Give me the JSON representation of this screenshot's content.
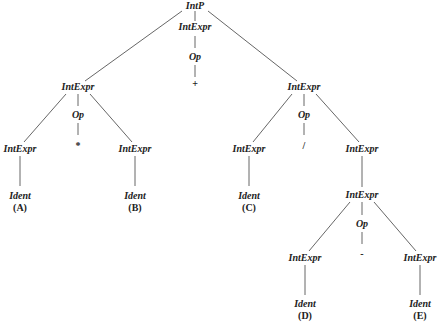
{
  "diagram": {
    "type": "parse-tree",
    "line_color": "#555555",
    "text_color": "#222222",
    "nodes": {
      "root": {
        "label": "IntP",
        "x": 195,
        "y": 6
      },
      "root_expr": {
        "label": "IntExpr",
        "x": 195,
        "y": 27
      },
      "root_op": {
        "label": "Op",
        "x": 195,
        "y": 57
      },
      "root_sym": {
        "label": "+",
        "x": 195,
        "y": 84
      },
      "l_expr": {
        "label": "IntExpr",
        "x": 78,
        "y": 87
      },
      "l_op": {
        "label": "Op",
        "x": 78,
        "y": 115
      },
      "l_sym": {
        "label": "*",
        "x": 78,
        "y": 146
      },
      "ll_expr": {
        "label": "IntExpr",
        "x": 20,
        "y": 149
      },
      "ll_ident": {
        "label": "Ident",
        "x": 20,
        "y": 196
      },
      "ll_val": {
        "label": "(A)",
        "x": 20,
        "y": 208
      },
      "lr_expr": {
        "label": "IntExpr",
        "x": 135,
        "y": 149
      },
      "lr_ident": {
        "label": "Ident",
        "x": 135,
        "y": 196
      },
      "lr_val": {
        "label": "(B)",
        "x": 135,
        "y": 208
      },
      "r_expr": {
        "label": "IntExpr",
        "x": 304,
        "y": 87
      },
      "r_op": {
        "label": "Op",
        "x": 304,
        "y": 115
      },
      "r_sym": {
        "label": "/",
        "x": 304,
        "y": 146
      },
      "rl_expr": {
        "label": "IntExpr",
        "x": 249,
        "y": 149
      },
      "rl_ident": {
        "label": "Ident",
        "x": 249,
        "y": 196
      },
      "rl_val": {
        "label": "(C)",
        "x": 249,
        "y": 208
      },
      "rr_expr": {
        "label": "IntExpr",
        "x": 362,
        "y": 149
      },
      "rr_inner": {
        "label": "IntExpr",
        "x": 362,
        "y": 195
      },
      "rr_op": {
        "label": "Op",
        "x": 362,
        "y": 224
      },
      "rr_sym": {
        "label": "-",
        "x": 362,
        "y": 254
      },
      "rrl_expr": {
        "label": "IntExpr",
        "x": 305,
        "y": 258
      },
      "rrl_ident": {
        "label": "Ident",
        "x": 305,
        "y": 304
      },
      "rrl_val": {
        "label": "(D)",
        "x": 305,
        "y": 316
      },
      "rrr_expr": {
        "label": "IntExpr",
        "x": 420,
        "y": 258
      },
      "rrr_ident": {
        "label": "Ident",
        "x": 420,
        "y": 304
      },
      "rrr_val": {
        "label": "(E)",
        "x": 420,
        "y": 316
      }
    }
  }
}
